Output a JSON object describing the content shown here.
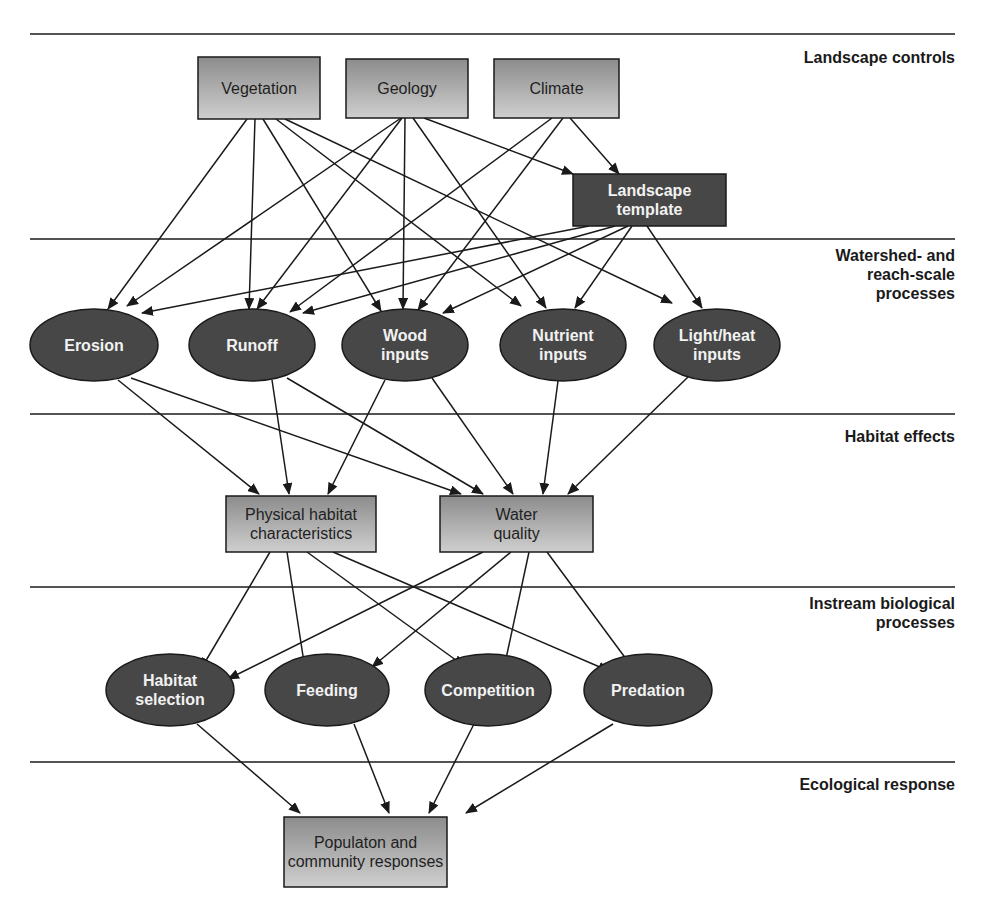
{
  "diagram": {
    "levels": [
      {
        "id": "landscape-controls",
        "label": "Landscape controls"
      },
      {
        "id": "watershed",
        "label": "Watershed- and\nreach-scale\nprocesses"
      },
      {
        "id": "habitat-effects",
        "label": "Habitat effects"
      },
      {
        "id": "instream",
        "label": "Instream biological\nprocesses"
      },
      {
        "id": "ecological-response",
        "label": "Ecological response"
      }
    ],
    "nodes": {
      "vegetation": {
        "label": [
          "Vegetation"
        ],
        "shape": "box-light",
        "level": "landscape-controls"
      },
      "geology": {
        "label": [
          "Geology"
        ],
        "shape": "box-light",
        "level": "landscape-controls"
      },
      "climate": {
        "label": [
          "Climate"
        ],
        "shape": "box-light",
        "level": "landscape-controls"
      },
      "landscape_template": {
        "label": [
          "Landscape",
          "template"
        ],
        "shape": "box-dark",
        "level": "landscape-controls"
      },
      "erosion": {
        "label": [
          "Erosion"
        ],
        "shape": "ellipse",
        "level": "watershed"
      },
      "runoff": {
        "label": [
          "Runoff"
        ],
        "shape": "ellipse",
        "level": "watershed"
      },
      "wood_inputs": {
        "label": [
          "Wood",
          "inputs"
        ],
        "shape": "ellipse",
        "level": "watershed"
      },
      "nutrient_inputs": {
        "label": [
          "Nutrient",
          "inputs"
        ],
        "shape": "ellipse",
        "level": "watershed"
      },
      "light_heat_inputs": {
        "label": [
          "Light/heat",
          "inputs"
        ],
        "shape": "ellipse",
        "level": "watershed"
      },
      "physical_habitat": {
        "label": [
          "Physical habitat",
          "characteristics"
        ],
        "shape": "box-light",
        "level": "habitat-effects"
      },
      "water_quality": {
        "label": [
          "Water",
          "quality"
        ],
        "shape": "box-light",
        "level": "habitat-effects"
      },
      "habitat_selection": {
        "label": [
          "Habitat",
          "selection"
        ],
        "shape": "ellipse",
        "level": "instream"
      },
      "feeding": {
        "label": [
          "Feeding"
        ],
        "shape": "ellipse",
        "level": "instream"
      },
      "competition": {
        "label": [
          "Competition"
        ],
        "shape": "ellipse",
        "level": "instream"
      },
      "predation": {
        "label": [
          "Predation"
        ],
        "shape": "ellipse",
        "level": "instream"
      },
      "population": {
        "label": [
          "Populaton and",
          "community responses"
        ],
        "shape": "box-light",
        "level": "ecological-response"
      }
    },
    "edges": [
      [
        "vegetation",
        "erosion"
      ],
      [
        "vegetation",
        "runoff"
      ],
      [
        "vegetation",
        "wood_inputs"
      ],
      [
        "vegetation",
        "nutrient_inputs"
      ],
      [
        "vegetation",
        "light_heat_inputs"
      ],
      [
        "geology",
        "erosion"
      ],
      [
        "geology",
        "runoff"
      ],
      [
        "geology",
        "wood_inputs"
      ],
      [
        "geology",
        "nutrient_inputs"
      ],
      [
        "geology",
        "landscape_template"
      ],
      [
        "climate",
        "runoff"
      ],
      [
        "climate",
        "wood_inputs"
      ],
      [
        "climate",
        "landscape_template"
      ],
      [
        "landscape_template",
        "erosion"
      ],
      [
        "landscape_template",
        "runoff"
      ],
      [
        "landscape_template",
        "wood_inputs"
      ],
      [
        "landscape_template",
        "nutrient_inputs"
      ],
      [
        "landscape_template",
        "light_heat_inputs"
      ],
      [
        "erosion",
        "physical_habitat"
      ],
      [
        "erosion",
        "water_quality"
      ],
      [
        "runoff",
        "physical_habitat"
      ],
      [
        "runoff",
        "water_quality"
      ],
      [
        "wood_inputs",
        "physical_habitat"
      ],
      [
        "wood_inputs",
        "water_quality"
      ],
      [
        "nutrient_inputs",
        "water_quality"
      ],
      [
        "light_heat_inputs",
        "water_quality"
      ],
      [
        "physical_habitat",
        "habitat_selection"
      ],
      [
        "physical_habitat",
        "feeding"
      ],
      [
        "physical_habitat",
        "competition"
      ],
      [
        "physical_habitat",
        "predation"
      ],
      [
        "water_quality",
        "habitat_selection"
      ],
      [
        "water_quality",
        "feeding"
      ],
      [
        "water_quality",
        "competition"
      ],
      [
        "water_quality",
        "predation"
      ],
      [
        "habitat_selection",
        "population"
      ],
      [
        "feeding",
        "population"
      ],
      [
        "competition",
        "population"
      ],
      [
        "predation",
        "population"
      ]
    ],
    "colors": {
      "box_gradient_top": "#8c8c8c",
      "box_gradient_bottom": "#cfcfcf",
      "dark_fill": "#474747",
      "stroke": "#1a1a1a",
      "light_text": "#f2f2f2",
      "dark_text": "#1f1f1f"
    }
  }
}
